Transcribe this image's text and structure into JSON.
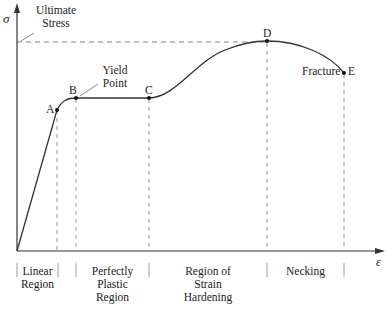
{
  "axes": {
    "y_symbol": "σ",
    "x_symbol": "ε"
  },
  "annotations": {
    "ultimate_stress": [
      "Ultimate",
      "Stress"
    ],
    "yield_point": [
      "Yield",
      "Point"
    ],
    "fracture": "Fracture"
  },
  "points": [
    {
      "label": "A",
      "name": "proportional-limit"
    },
    {
      "label": "B",
      "name": "yield-point"
    },
    {
      "label": "C",
      "name": "start-strain-hardening"
    },
    {
      "label": "D",
      "name": "ultimate-stress"
    },
    {
      "label": "E",
      "name": "fracture"
    }
  ],
  "regions": [
    {
      "lines": [
        "Linear",
        "Region"
      ]
    },
    {
      "lines": [
        "Perfectly",
        "Plastic",
        "Region"
      ]
    },
    {
      "lines": [
        "Region of",
        "Strain",
        "Hardening"
      ]
    },
    {
      "lines": [
        "Necking"
      ]
    }
  ]
}
